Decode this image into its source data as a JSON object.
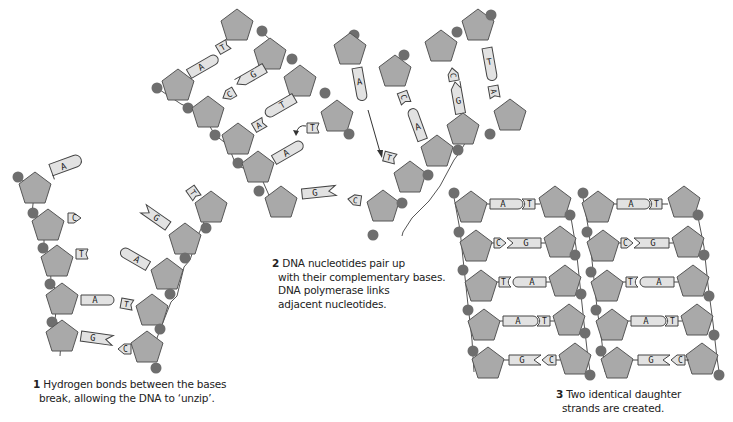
{
  "colors": {
    "sugar_fill": "#a9a9a9",
    "sugar_stroke": "#555555",
    "phosphate": "#6e6e6e",
    "base_fill": "#e2e2e2",
    "base_stroke": "#444444",
    "text": "#222222"
  },
  "icons": {
    "sugar": "pentagon-icon",
    "phosphate": "circle-icon",
    "base": "rounded-tag-icon",
    "arrow": "arrow-icon"
  },
  "steps": [
    {
      "number": "1",
      "lines": [
        "Hydrogen bonds between the bases",
        "break, allowing the DNA to ‘unzip’."
      ]
    },
    {
      "number": "2",
      "lines": [
        "DNA nucleotides pair up",
        "with their complementary bases.",
        "DNA polymerase links",
        "adjacent nucleotides."
      ]
    },
    {
      "number": "3",
      "lines": [
        "Two identical daughter",
        "strands are created."
      ]
    }
  ],
  "panel1": {
    "left_strand": [
      "A",
      "C",
      "T",
      "A",
      "G"
    ],
    "right_strand": [
      "T",
      "G",
      "A",
      "T",
      "C"
    ]
  },
  "panel2": {
    "old_strand_left": [
      "A",
      "G",
      "T",
      "A",
      "G"
    ],
    "new_pairs_left": [
      "T",
      "C",
      "A",
      "T",
      "C"
    ],
    "free_nucleotide": "A",
    "right_strand": [
      "T",
      "C",
      "A"
    ],
    "right_new": [
      "A",
      "G",
      "T"
    ]
  },
  "panel3": {
    "strands": [
      {
        "left": [
          "A",
          "C",
          "T",
          "A",
          "G"
        ],
        "right": [
          "T",
          "G",
          "A",
          "T",
          "C"
        ]
      },
      {
        "left": [
          "A",
          "C",
          "T",
          "A",
          "G"
        ],
        "right": [
          "T",
          "G",
          "A",
          "T",
          "C"
        ]
      }
    ]
  }
}
